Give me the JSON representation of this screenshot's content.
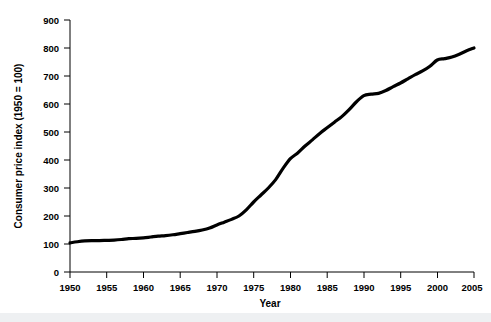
{
  "chart_data": {
    "type": "line",
    "title": "",
    "xlabel": "Year",
    "ylabel": "Consumer price index (1950 = 100)",
    "xlim": [
      1950,
      2005
    ],
    "ylim": [
      0,
      900
    ],
    "xticks": [
      1950,
      1955,
      1960,
      1965,
      1970,
      1975,
      1980,
      1985,
      1990,
      1995,
      2000,
      2005
    ],
    "yticks": [
      0,
      100,
      200,
      300,
      400,
      500,
      600,
      700,
      800,
      900
    ],
    "grid": false,
    "legend": false,
    "line_color": "#000000",
    "line_width": 3.2,
    "series": [
      {
        "name": "Consumer price index",
        "x": [
          1950,
          1951,
          1952,
          1953,
          1954,
          1955,
          1956,
          1957,
          1958,
          1959,
          1960,
          1961,
          1962,
          1963,
          1964,
          1965,
          1966,
          1967,
          1968,
          1969,
          1970,
          1971,
          1972,
          1973,
          1974,
          1975,
          1976,
          1977,
          1978,
          1979,
          1980,
          1981,
          1982,
          1983,
          1984,
          1985,
          1986,
          1987,
          1988,
          1989,
          1990,
          1991,
          1992,
          1993,
          1994,
          1995,
          1996,
          1997,
          1998,
          1999,
          2000,
          2001,
          2002,
          2003,
          2004,
          2005
        ],
        "values": [
          104,
          108,
          111,
          112,
          112,
          113,
          114,
          116,
          119,
          120,
          122,
          125,
          128,
          130,
          133,
          137,
          141,
          145,
          150,
          157,
          168,
          178,
          188,
          200,
          222,
          250,
          275,
          300,
          330,
          370,
          405,
          425,
          450,
          472,
          495,
          515,
          535,
          555,
          580,
          608,
          630,
          635,
          638,
          648,
          662,
          675,
          690,
          705,
          718,
          735,
          757,
          762,
          768,
          778,
          790,
          800
        ]
      }
    ]
  },
  "axis": {
    "y_label": "Consumer price index (1950 = 100)",
    "x_label": "Year",
    "y_tick_labels": [
      "900",
      "800",
      "700",
      "600",
      "500",
      "400",
      "300",
      "200",
      "100",
      "0"
    ],
    "x_tick_labels": [
      "1950",
      "1955",
      "1960",
      "1965",
      "1970",
      "1975",
      "1980",
      "1985",
      "1990",
      "1995",
      "2000",
      "2005"
    ]
  },
  "colors": {
    "background": "#ffffff",
    "line": "#000000",
    "axis": "#000000",
    "bottom_strip": "#eef0f2"
  }
}
